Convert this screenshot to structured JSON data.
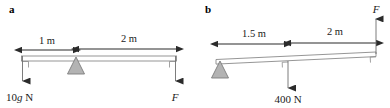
{
  "figure": {
    "type": "physics-free-body-diagram",
    "background_color": "#ffffff",
    "ink_color": "#2b2b2b",
    "beam_color": "#8a8a8a",
    "fulcrum_fill": "#b3b3b3",
    "fulcrum_stroke": "#7d7d7d"
  },
  "panels": [
    {
      "id": "a",
      "label": "a",
      "beam": {
        "tilt": "horizontal"
      },
      "fulcrum": {
        "position_label": "pivot",
        "shape": "triangle"
      },
      "dimensions": [
        {
          "name": "left-span",
          "text": "1 m",
          "value": 1,
          "unit": "m"
        },
        {
          "name": "right-span",
          "text": "2 m",
          "value": 2,
          "unit": "m"
        }
      ],
      "forces": [
        {
          "name": "weight",
          "text": "10g N",
          "symbol": "10g",
          "unit": "N",
          "direction": "down",
          "location": "left-end"
        },
        {
          "name": "applied-force",
          "text": "F",
          "symbol": "F",
          "direction": "down",
          "location": "right-end",
          "italic": true
        }
      ]
    },
    {
      "id": "b",
      "label": "b",
      "beam": {
        "tilt": "slightly-tilted-up-right"
      },
      "fulcrum": {
        "position_label": "left-end",
        "shape": "triangle"
      },
      "dimensions": [
        {
          "name": "left-span",
          "text": "1.5 m",
          "value": 1.5,
          "unit": "m"
        },
        {
          "name": "right-span",
          "text": "2 m",
          "value": 2,
          "unit": "m"
        }
      ],
      "forces": [
        {
          "name": "load",
          "text": "400 N",
          "symbol": "400",
          "unit": "N",
          "direction": "down",
          "location": "middle"
        },
        {
          "name": "applied-force",
          "text": "F",
          "symbol": "F",
          "direction": "up",
          "location": "right-end",
          "italic": true
        }
      ]
    }
  ]
}
